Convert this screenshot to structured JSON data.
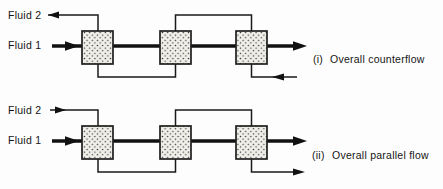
{
  "figure": {
    "background_color": "#fdfdfd",
    "line_color": "#1a1a1a",
    "exchanger_box": {
      "fill": "#f1efe9",
      "dot_color": "#3a3a3a",
      "border_color": "#1f1f1f",
      "count_per_row": 3
    },
    "diagrams": [
      {
        "fluid2_label": "Fluid 2",
        "fluid1_label": "Fluid 1",
        "caption_index": "(i)",
        "caption_text": "Overall counterflow",
        "fluid1_direction": "left-to-right",
        "fluid2_direction": "right-to-left serpentine"
      },
      {
        "fluid2_label": "Fluid 2",
        "fluid1_label": "Fluid 1",
        "caption_index": "(ii)",
        "caption_text": "Overall parallel flow",
        "fluid1_direction": "left-to-right",
        "fluid2_direction": "left-to-right serpentine"
      }
    ]
  }
}
